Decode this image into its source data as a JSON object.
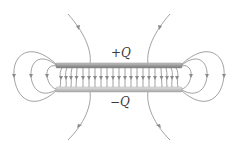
{
  "diagram": {
    "labels": {
      "top_plate_charge": "+Q",
      "bottom_plate_charge": "−Q"
    },
    "colors": {
      "field_line": "#8a8a8a",
      "top_plate": "#9a9a9a",
      "top_plate_highlight": "#c8c8c8",
      "bottom_plate": "#c4c4c4",
      "bottom_plate_highlight": "#e6e6e6",
      "label": "#3a3a3a"
    },
    "plates": {
      "top": {
        "x": 56,
        "y": 63,
        "width": 126,
        "height": 5,
        "charge": "+Q"
      },
      "bottom": {
        "x": 56,
        "y": 87,
        "width": 126,
        "height": 5,
        "charge": "−Q"
      }
    },
    "interior_field_line_count": 21,
    "field_direction": "top plate to bottom plate (downward)"
  }
}
